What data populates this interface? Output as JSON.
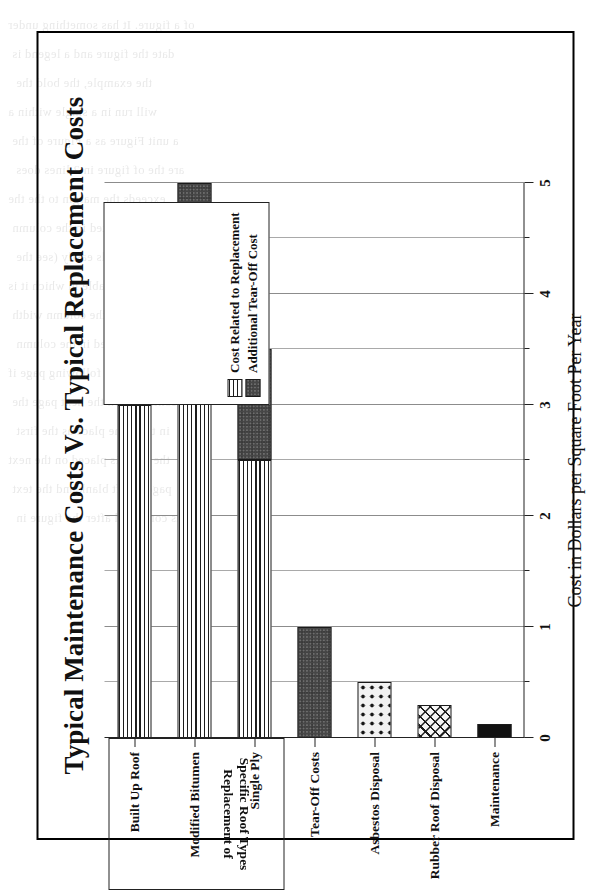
{
  "chart_data": {
    "type": "bar",
    "orientation": "horizontal",
    "title": "Typical Maintenance Costs Vs. Typical Replacement Costs",
    "xlabel": "Cost in Dollars per Square Foot Per Year",
    "ylabel": "",
    "xlim": [
      0,
      5
    ],
    "xticks": [
      0,
      1,
      2,
      3,
      4,
      5
    ],
    "xticklabels": [
      "0",
      "1",
      "2",
      "3",
      "4",
      "5"
    ],
    "minor_tick_step": 0.5,
    "grid": true,
    "grid_axis": "x",
    "legend_position": "inside-right",
    "categories": [
      "Built Up Roof",
      "Modified Bitumen",
      "Single Ply",
      "Tear-Off Costs",
      "Asbestos Disposal",
      "Rubber Roof Disposal",
      "Maintenance"
    ],
    "series": [
      {
        "name": "Cost Related to Replacement",
        "pattern": "horizontal-lines",
        "values": [
          3.0,
          4.0,
          2.5,
          0,
          0,
          0,
          0
        ]
      },
      {
        "name": "Additional Tear-Off Cost",
        "pattern": "dark-checker",
        "values": [
          1.0,
          1.0,
          1.0,
          1.0,
          0,
          0,
          0
        ]
      }
    ],
    "totals": [
      4.0,
      5.0,
      3.5,
      1.0,
      0.5,
      0.3,
      0.13
    ],
    "bars": [
      {
        "label": "Built Up Roof",
        "segments": [
          {
            "series": "Cost Related to Replacement",
            "start": 0,
            "end": 3.0,
            "pattern": "horizontal-lines"
          },
          {
            "series": "Additional Tear-Off Cost",
            "start": 3.0,
            "end": 4.0,
            "pattern": "dark-checker"
          }
        ]
      },
      {
        "label": "Modified Bitumen",
        "segments": [
          {
            "series": "Cost Related to Replacement",
            "start": 0,
            "end": 4.0,
            "pattern": "horizontal-lines"
          },
          {
            "series": "Additional Tear-Off Cost",
            "start": 4.0,
            "end": 5.0,
            "pattern": "dark-checker"
          }
        ]
      },
      {
        "label": "Single Ply",
        "segments": [
          {
            "series": "Cost Related to Replacement",
            "start": 0,
            "end": 2.5,
            "pattern": "horizontal-lines"
          },
          {
            "series": "Additional Tear-Off Cost",
            "start": 2.5,
            "end": 3.5,
            "pattern": "dark-checker"
          }
        ]
      },
      {
        "label": "Tear-Off Costs",
        "segments": [
          {
            "series": "Additional Tear-Off Cost",
            "start": 0,
            "end": 1.0,
            "pattern": "dark-checker"
          }
        ]
      },
      {
        "label": "Asbestos Disposal",
        "segments": [
          {
            "series": "Asbestos Disposal",
            "start": 0,
            "end": 0.5,
            "pattern": "dots"
          }
        ]
      },
      {
        "label": "Rubber Roof Disposal",
        "segments": [
          {
            "series": "Rubber Roof Disposal",
            "start": 0,
            "end": 0.3,
            "pattern": "cross-hatch"
          }
        ]
      },
      {
        "label": "Maintenance",
        "segments": [
          {
            "series": "Maintenance",
            "start": 0,
            "end": 0.13,
            "pattern": "solid-black"
          }
        ]
      }
    ],
    "group_box": {
      "line1": "Replacement of",
      "line2": "Specific Roof Types",
      "members": [
        "Built Up Roof",
        "Modified Bitumen",
        "Single Ply"
      ],
      "text_orientation": "upside-down"
    },
    "legend_entries": [
      {
        "label": "Cost Related to Replacement",
        "pattern": "horizontal-lines"
      },
      {
        "label": "Additional Tear-Off Cost",
        "pattern": "dark-checker"
      }
    ],
    "colors": {
      "ink": "#111111",
      "grid": "#a9a9a9",
      "frame": "#000000",
      "checker_fill": "#6e6e6e",
      "solid_fill": "#111111",
      "page": "#ffffff"
    },
    "page_rotation_degrees": -90
  },
  "ghost_text": [
    "of a figure. It has something under",
    "date the  figure  and  a  legend  is",
    "the  example, the  bold  the",
    "will run  in  a  single  within  a",
    "a  unit   Figure  as   a   Figure   of  the",
    "are  the  of  figure  in  2 lines  does",
    "exceeds  the  margin  to  the  the",
    "list  the  is  printed  in  the  column",
    "so  that  it   reads  easily   (see   the",
    "page  as  the  table  in  which  it  is",
    "to  make  it  fit  the  column  width",
    "we,  will  be  printed  in  the  column",
    "and  the   following   page   if",
    "continued  on  the  next  page  the",
    "in  the  same  place  as  the  first",
    "the  chart  is  placed  on  the  next",
    "page  is  left  blank  and  the  text",
    "is  continued  after  the  figure  in"
  ]
}
